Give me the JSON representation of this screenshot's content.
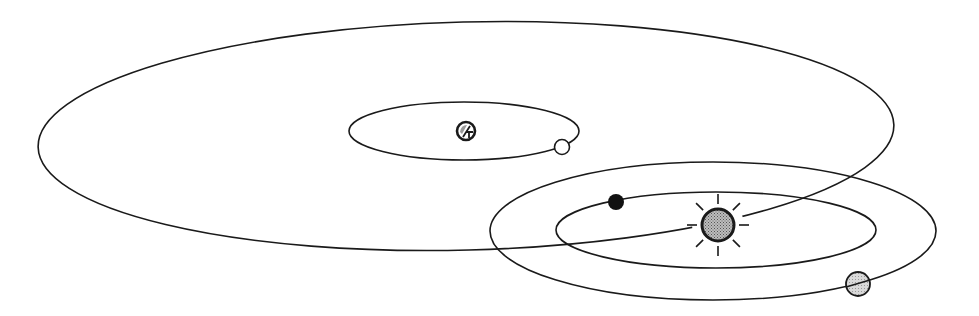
{
  "diagram": {
    "type": "orbital-diagram",
    "canvas": {
      "width": 979,
      "height": 316,
      "background": "#ffffff"
    },
    "colors": {
      "line": "#1a1a1a",
      "sun_fill": "#a8a8a8",
      "planet_gray": "#c8c8c8",
      "planet_black": "#111111",
      "planet_white": "#ffffff",
      "hatched_body": "#9a9a9a"
    },
    "orbits": [
      {
        "id": "large-outer-orbit",
        "cx": 466,
        "cy": 136,
        "rx": 428,
        "ry": 114,
        "rotate": -1.5
      },
      {
        "id": "small-orbit-around-hatched-body",
        "cx": 464,
        "cy": 131,
        "rx": 115,
        "ry": 29,
        "rotate": 0
      },
      {
        "id": "outer-solar-orbit",
        "cx": 713,
        "cy": 231,
        "rx": 223,
        "ry": 69,
        "rotate": 0
      },
      {
        "id": "inner-solar-orbit",
        "cx": 716,
        "cy": 230,
        "rx": 160,
        "ry": 38,
        "rotate": 0
      }
    ],
    "bodies": [
      {
        "id": "sun",
        "cx": 718,
        "cy": 225,
        "r": 16,
        "kind": "sun"
      },
      {
        "id": "black-planet",
        "cx": 616,
        "cy": 202,
        "r": 8,
        "kind": "black"
      },
      {
        "id": "gray-planet",
        "cx": 858,
        "cy": 284,
        "r": 12,
        "kind": "gray"
      },
      {
        "id": "white-moon",
        "cx": 562,
        "cy": 147,
        "r": 7.5,
        "kind": "white"
      },
      {
        "id": "hatched-body",
        "cx": 466,
        "cy": 131,
        "r": 9,
        "kind": "hatched"
      }
    ],
    "sun_rays": {
      "inner": 21,
      "outer": 31,
      "count": 8
    }
  }
}
